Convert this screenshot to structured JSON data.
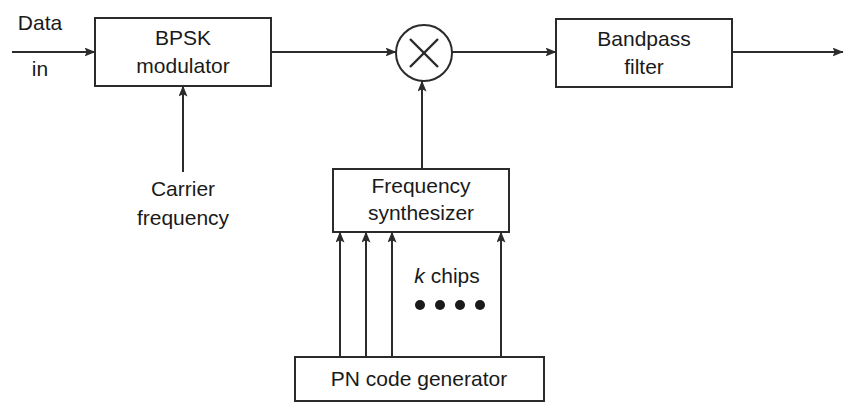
{
  "diagram": {
    "colors": {
      "background": "#ffffff",
      "line": "#2b2b2b",
      "text": "#1a1a1a"
    },
    "blocks": [
      {
        "id": "bpsk-modulator",
        "line1": "BPSK",
        "line2": "modulator",
        "x": 95,
        "y": 18,
        "w": 176,
        "h": 68
      },
      {
        "id": "bandpass-filter",
        "line1": "Bandpass",
        "line2": "filter",
        "x": 556,
        "y": 19,
        "w": 176,
        "h": 68
      },
      {
        "id": "frequency-synthesizer",
        "line1": "Frequency",
        "line2": "synthesizer",
        "x": 333,
        "y": 169,
        "w": 176,
        "h": 63
      },
      {
        "id": "pn-code-generator",
        "line1": "PN code generator",
        "line2": "",
        "x": 295,
        "y": 357,
        "w": 249,
        "h": 44
      }
    ],
    "multiplier": {
      "id": "multiplier",
      "symbol": "×",
      "cx": 424,
      "cy": 53,
      "r": 28
    },
    "labels": [
      {
        "id": "data-in-top",
        "text": "Data",
        "x": 40,
        "y": 24
      },
      {
        "id": "data-in-bottom",
        "text": "in",
        "x": 40,
        "y": 70
      },
      {
        "id": "carrier-top",
        "text": "Carrier",
        "x": 183,
        "y": 190
      },
      {
        "id": "carrier-bottom",
        "text": "frequency",
        "x": 183,
        "y": 219
      },
      {
        "id": "k-chips-k",
        "text": "k",
        "x": 428,
        "y": 277
      },
      {
        "id": "k-chips-rest",
        "text": "chips",
        "x": 441,
        "y": 277
      }
    ],
    "chip_dots": {
      "count": 4,
      "xs": [
        420,
        440,
        460,
        480
      ],
      "y": 305,
      "r": 5
    }
  }
}
